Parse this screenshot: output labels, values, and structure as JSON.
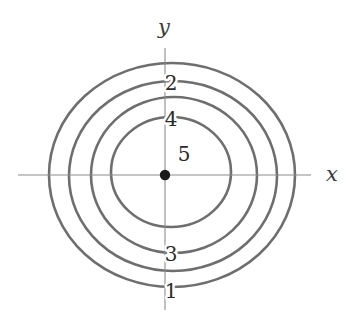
{
  "figure": {
    "background_color": "#ffffff",
    "width": 361,
    "height": 317
  },
  "axes": {
    "x_axis_label": "x",
    "y_axis_label": "y",
    "axis_color": "#8c8c8c",
    "axis_stroke_width": 1.1,
    "origin": {
      "x": 165,
      "y": 175
    },
    "x_axis_extent": {
      "from_x": 18,
      "to_x": 311
    },
    "y_axis_extent": {
      "from_y": 48,
      "to_y": 310
    },
    "x_label_position": {
      "x": 332,
      "y": 174
    },
    "y_label_position": {
      "x": 164,
      "y": 34
    }
  },
  "origin_marker": {
    "name": "origin-point",
    "color": "#1a1a1a",
    "radius": 5.2,
    "x": 165,
    "y": 175
  },
  "curve_style": {
    "color": "#6e6e6e",
    "stroke_width": 2.6
  },
  "chart_data": {
    "type": "line",
    "xlabel": "x",
    "ylabel": "y",
    "grid": false,
    "legend": "none",
    "origin_marked": true,
    "curve_labels": [
      "2",
      "4",
      "5",
      "3",
      "1"
    ],
    "curves": [
      {
        "label": "1",
        "order": "outermost",
        "center": {
          "x": 172,
          "y": 175
        },
        "radius_x": 123,
        "radius_y": 112,
        "x_axis_crossings": [
          50,
          295
        ],
        "y_axis_crossings": [
          63,
          287
        ],
        "label_position": {
          "x": 171,
          "y": 290
        }
      },
      {
        "label": "2",
        "order": "second",
        "center": {
          "x": 173,
          "y": 176
        },
        "radius_x": 104,
        "radius_y": 95,
        "x_axis_crossings": [
          70,
          277
        ],
        "y_axis_crossings": [
          82,
          271
        ],
        "label_position": {
          "x": 171,
          "y": 82
        }
      },
      {
        "label": "3",
        "order": "third",
        "center": {
          "x": 174,
          "y": 175
        },
        "radius_x": 83,
        "radius_y": 78,
        "x_axis_crossings": [
          92,
          257
        ],
        "y_axis_crossings": [
          98,
          253
        ],
        "label_position": {
          "x": 171,
          "y": 253
        }
      },
      {
        "label": "4",
        "order": "innermost",
        "center": {
          "x": 171,
          "y": 172
        },
        "radius_x": 60,
        "radius_y": 55,
        "x_axis_crossings": [
          112,
          231
        ],
        "y_axis_crossings": [
          118,
          227
        ],
        "label_position": {
          "x": 171,
          "y": 118
        }
      }
    ],
    "point_labels": [
      {
        "label": "5",
        "description": "interior region at the centre, adjacent to the origin point",
        "position": {
          "x": 184,
          "y": 153
        }
      }
    ]
  }
}
